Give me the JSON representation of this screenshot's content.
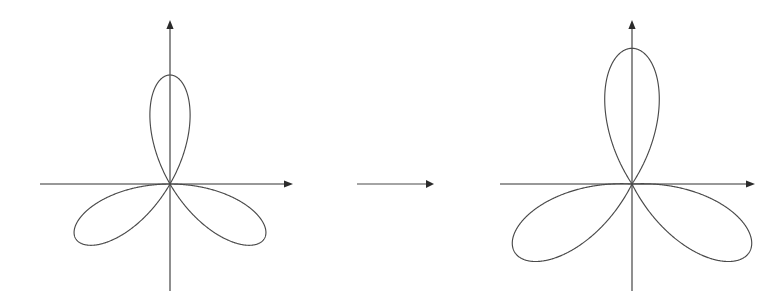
{
  "figure": {
    "background_color": "#ffffff",
    "curve_color": "#4a4a4a",
    "axis_color": "#333333",
    "width": 775,
    "height": 303,
    "panel_count": 2,
    "relation_label": ""
  },
  "transform_arrow": {
    "name": "transformation-arrow",
    "x_start": 357,
    "x_end": 434,
    "y": 184,
    "direction": "right",
    "label": ""
  },
  "chart_data": [
    {
      "type": "line",
      "subtype": "polar-rose",
      "name": "left-rose",
      "title": "",
      "xlabel": "",
      "ylabel": "",
      "equation": "r = cos(3θ)",
      "petal_count": 3,
      "petal_angles_deg": [
        90,
        210,
        330
      ],
      "a_offset": 0.0,
      "b_amplitude": 1.0,
      "k_frequency": 3,
      "grid": false,
      "legend": false,
      "axes": {
        "origin_x": 170,
        "origin_y": 184,
        "x_axis_start": 40,
        "x_axis_end": 287,
        "y_axis_top": 26,
        "y_axis_bottom": 291,
        "arrowheads": [
          "x-positive",
          "y-positive"
        ]
      },
      "scale_px": 109,
      "petal_tips": [
        {
          "angle_deg": 90,
          "x": 170,
          "y": 75
        },
        {
          "angle_deg": 210,
          "x": 76,
          "y": 238
        },
        {
          "angle_deg": 330,
          "x": 264,
          "y": 238
        }
      ]
    },
    {
      "type": "line",
      "subtype": "polar-rose",
      "name": "right-rose",
      "title": "",
      "xlabel": "",
      "ylabel": "",
      "equation": "r = 0.18 + cos(3θ)",
      "petal_count": 3,
      "petal_angles_deg": [
        90,
        210,
        330
      ],
      "a_offset": 0.18,
      "b_amplitude": 1.0,
      "k_frequency": 3,
      "grid": false,
      "legend": false,
      "axes": {
        "origin_x": 632,
        "origin_y": 184,
        "x_axis_start": 500,
        "x_axis_end": 749,
        "y_axis_top": 26,
        "y_axis_bottom": 291,
        "arrowheads": [
          "x-positive",
          "y-positive"
        ]
      },
      "scale_px": 115,
      "petal_tips": [
        {
          "angle_deg": 90,
          "x": 632,
          "y": 48
        },
        {
          "angle_deg": 210,
          "x": 530,
          "y": 262
        },
        {
          "angle_deg": 330,
          "x": 734,
          "y": 262
        }
      ]
    }
  ]
}
